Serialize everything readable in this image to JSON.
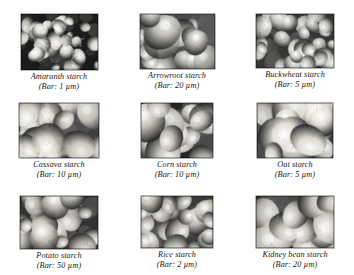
{
  "figure": {
    "background_color": "#ffffff",
    "columns": 3,
    "rows": 3
  },
  "panels": [
    {
      "id": "amaranth",
      "name": "Amaranth starch",
      "bar": "(Bar: 1 µm)",
      "scale_value": "1",
      "scale_unit": "µm",
      "row": 1,
      "column": 1,
      "frame": {
        "x": 18,
        "y": 14,
        "width": 77,
        "height": 56
      },
      "tone": "dark",
      "background_color": "#1b1b1b",
      "granule_color": "#e8e6df",
      "granule_count": 34,
      "granule_size": [
        4,
        9
      ],
      "watermark": "SciMAT",
      "has_watermark": true
    },
    {
      "id": "arrowroot",
      "name": "Arrowroot starch",
      "bar": "(Bar: 20 µm)",
      "scale_value": "20",
      "scale_unit": "µm",
      "row": 1,
      "column": 2,
      "frame": {
        "x": 140,
        "y": 17,
        "width": 75,
        "height": 55
      },
      "tone": "mid",
      "background_color": "#4a4a4a",
      "granule_color": "#b9b7b0",
      "granule_count": 18,
      "granule_size": [
        9,
        17
      ],
      "watermark": "",
      "has_watermark": false
    },
    {
      "id": "buckwheat",
      "name": "Buckwheat starch",
      "bar": "(Bar: 5 µm)",
      "scale_value": "5",
      "scale_unit": "µm",
      "row": 1,
      "column": 3,
      "frame": {
        "x": 262,
        "y": 18,
        "width": 78,
        "height": 54
      },
      "tone": "mid-dark",
      "background_color": "#353535",
      "granule_color": "#cfcdc6",
      "granule_count": 30,
      "granule_size": [
        6,
        12
      ],
      "watermark": "",
      "has_watermark": false
    },
    {
      "id": "cassava",
      "name": "Cassava starch",
      "bar": "(Bar: 10 µm)",
      "scale_value": "10",
      "scale_unit": "µm",
      "row": 2,
      "column": 1,
      "frame": {
        "x": 17,
        "y": 103,
        "width": 80,
        "height": 55
      },
      "tone": "light",
      "background_color": "#404040",
      "granule_color": "#ddd9d0",
      "granule_count": 20,
      "granule_size": [
        9,
        18
      ],
      "watermark": "",
      "has_watermark": false
    },
    {
      "id": "corn",
      "name": "Corn starch",
      "bar": "(Bar: 10 µm)",
      "scale_value": "10",
      "scale_unit": "µm",
      "row": 2,
      "column": 2,
      "frame": {
        "x": 140,
        "y": 102,
        "width": 72,
        "height": 55
      },
      "tone": "contrast",
      "background_color": "#262626",
      "granule_color": "#c8c5bd",
      "granule_count": 17,
      "granule_size": [
        10,
        19
      ],
      "watermark": "",
      "has_watermark": false
    },
    {
      "id": "oat",
      "name": "Oat starch",
      "bar": "(Bar: 5 µm)",
      "scale_value": "5",
      "scale_unit": "µm",
      "row": 2,
      "column": 3,
      "frame": {
        "x": 262,
        "y": 102,
        "width": 76,
        "height": 55
      },
      "tone": "light",
      "background_color": "#3b3b3b",
      "granule_color": "#e2dfd7",
      "granule_count": 16,
      "granule_size": [
        11,
        20
      ],
      "watermark": "",
      "has_watermark": false
    },
    {
      "id": "potato",
      "name": "Potato starch",
      "bar": "(Bar: 50 µm)",
      "scale_value": "50",
      "scale_unit": "µm",
      "row": 3,
      "column": 1,
      "frame": {
        "x": 17,
        "y": 184,
        "width": 78,
        "height": 53
      },
      "tone": "mid",
      "background_color": "#333333",
      "granule_color": "#cbc8c0",
      "granule_count": 26,
      "granule_size": [
        7,
        15
      ],
      "watermark": "",
      "has_watermark": false
    },
    {
      "id": "rice",
      "name": "Rice starch",
      "bar": "(Bar: 2 µm)",
      "scale_value": "2",
      "scale_unit": "µm",
      "row": 3,
      "column": 2,
      "frame": {
        "x": 140,
        "y": 183,
        "width": 72,
        "height": 52
      },
      "tone": "mid",
      "background_color": "#3a3a3a",
      "granule_color": "#c4c1b9",
      "granule_count": 28,
      "granule_size": [
        6,
        13
      ],
      "watermark": "",
      "has_watermark": false
    },
    {
      "id": "kidney-bean",
      "name": "Kidney bean starch",
      "bar": "(Bar: 20 µm)",
      "scale_value": "20",
      "scale_unit": "µm",
      "row": 3,
      "column": 3,
      "frame": {
        "x": 262,
        "y": 183,
        "width": 78,
        "height": 52
      },
      "tone": "mid",
      "background_color": "#2f2f2f",
      "granule_color": "#cdcac2",
      "granule_count": 15,
      "granule_size": [
        12,
        21
      ],
      "watermark": "",
      "has_watermark": false
    }
  ]
}
